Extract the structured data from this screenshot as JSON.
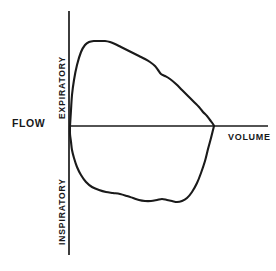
{
  "figure": {
    "title": "",
    "background_color": "#ffffff",
    "line_color": "#1a1a1a"
  },
  "labels": {
    "flow": "FLOW",
    "volume": "VOLUME",
    "expiratory": "EXPIRATORY",
    "inspiratory": "INSPIRATORY"
  },
  "chart_data": {
    "type": "line",
    "title": "",
    "subtitle": "",
    "xlabel": "VOLUME",
    "ylabel": "FLOW",
    "grid": false,
    "legend": null,
    "annotations": [
      {
        "text": "EXPIRATORY",
        "position": "upper-left-axis",
        "rotation": -90
      },
      {
        "text": "INSPIRATORY",
        "position": "lower-left-axis",
        "rotation": -90
      }
    ],
    "axes": {
      "x_axis": {
        "label": "VOLUME",
        "origin_px": 69,
        "end_px": 268,
        "y_px": 126,
        "ticks": [],
        "tick_labels": []
      },
      "y_axis": {
        "label": "FLOW",
        "origin_px": 126,
        "top_px": 11,
        "bottom_px": 255,
        "x_px": 69,
        "ticks": [],
        "tick_labels": []
      }
    },
    "series": [
      {
        "name": "Expiratory limb",
        "description": "Expiratory flow-volume curve: rapid rise to peak expiratory flow then gradual decline to residual volume",
        "points_px": [
          [
            70,
            126
          ],
          [
            71,
            110
          ],
          [
            72,
            95
          ],
          [
            74,
            80
          ],
          [
            77,
            65
          ],
          [
            81,
            52
          ],
          [
            85,
            45
          ],
          [
            89,
            42
          ],
          [
            94,
            41
          ],
          [
            99,
            41
          ],
          [
            105,
            41
          ],
          [
            110,
            42
          ],
          [
            115,
            44
          ],
          [
            121,
            47
          ],
          [
            127,
            50
          ],
          [
            133,
            53
          ],
          [
            139,
            56
          ],
          [
            145,
            59
          ],
          [
            150,
            62
          ],
          [
            155,
            66
          ],
          [
            158,
            70
          ],
          [
            161,
            74
          ],
          [
            165,
            76
          ],
          [
            170,
            79
          ],
          [
            176,
            84
          ],
          [
            182,
            90
          ],
          [
            188,
            96
          ],
          [
            194,
            102
          ],
          [
            199,
            107
          ],
          [
            203,
            112
          ],
          [
            207,
            116
          ],
          [
            210,
            120
          ],
          [
            213,
            124
          ],
          [
            214,
            126
          ]
        ]
      },
      {
        "name": "Inspiratory limb",
        "description": "Inspiratory flow-volume curve: steep initial drop, broad saucer-shaped trough, then rise back to total lung capacity",
        "points_px": [
          [
            70,
            126
          ],
          [
            70,
            134
          ],
          [
            71,
            142
          ],
          [
            72,
            150
          ],
          [
            74,
            158
          ],
          [
            77,
            167
          ],
          [
            81,
            175
          ],
          [
            86,
            182
          ],
          [
            92,
            187
          ],
          [
            99,
            190
          ],
          [
            106,
            192
          ],
          [
            113,
            193
          ],
          [
            120,
            194
          ],
          [
            127,
            196
          ],
          [
            133,
            198
          ],
          [
            139,
            200
          ],
          [
            145,
            201
          ],
          [
            151,
            201
          ],
          [
            157,
            200
          ],
          [
            162,
            199
          ],
          [
            167,
            200
          ],
          [
            172,
            201
          ],
          [
            177,
            202
          ],
          [
            182,
            201
          ],
          [
            187,
            198
          ],
          [
            192,
            192
          ],
          [
            197,
            183
          ],
          [
            201,
            173
          ],
          [
            205,
            161
          ],
          [
            208,
            149
          ],
          [
            211,
            138
          ],
          [
            213,
            130
          ],
          [
            214,
            126
          ]
        ]
      }
    ]
  }
}
